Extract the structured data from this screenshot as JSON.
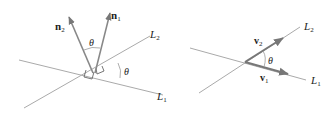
{
  "left_diagram": {
    "normal_1": {
      "label": "n",
      "subscript": "1"
    },
    "normal_2": {
      "label": "n",
      "subscript": "2"
    },
    "line_1": {
      "label": "L",
      "subscript": "1"
    },
    "line_2": {
      "label": "L",
      "subscript": "2"
    },
    "angle_between_normals": "θ",
    "angle_between_lines": "θ"
  },
  "right_diagram": {
    "vector_1": {
      "label": "v",
      "subscript": "1"
    },
    "vector_2": {
      "label": "v",
      "subscript": "2"
    },
    "line_1": {
      "label": "L",
      "subscript": "1"
    },
    "line_2": {
      "label": "L",
      "subscript": "2"
    },
    "angle": "θ"
  },
  "colors": {
    "line": "#a8a8a8",
    "arrow": "#7a7a7a",
    "text": "#222222"
  }
}
